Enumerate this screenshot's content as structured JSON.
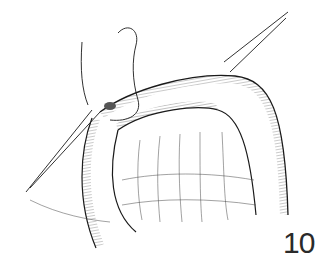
{
  "figure": {
    "number": "10",
    "colors": {
      "ink": "#1a1a1a",
      "background": "#ffffff",
      "label": "#2a2a2a"
    }
  }
}
